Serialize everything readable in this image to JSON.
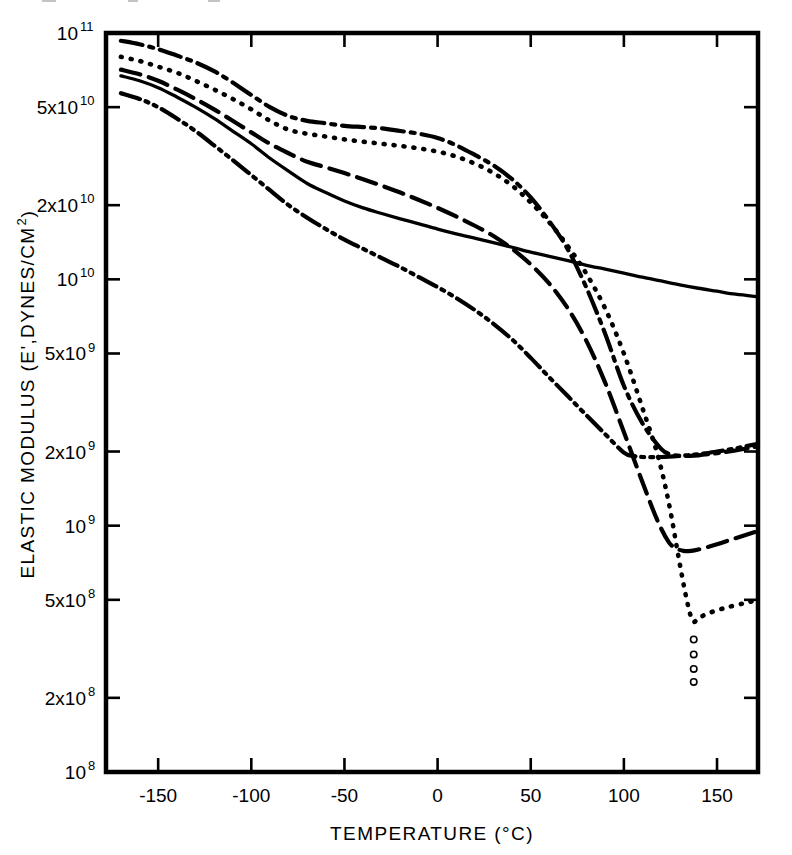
{
  "figure": {
    "background_color": "#ffffff",
    "ink_color": "#000000"
  },
  "chart_data": {
    "type": "line",
    "title": "",
    "subtitle": "",
    "xlabel": "TEMPERATURE (°C)",
    "ylabel": "ELASTIC MODULUS (E', DYNES/CM²)",
    "ylabel_parts": {
      "main": "ELASTIC MODULUS (E',DYNES/CM",
      "superscript": "2",
      "tail": ")"
    },
    "xscale": "linear",
    "yscale": "log",
    "xlim": [
      -178,
      172
    ],
    "ylim": [
      100000000,
      100000000000
    ],
    "grid": false,
    "legend": "none",
    "legend_position": "none",
    "xticks": [
      -150,
      -100,
      -50,
      0,
      50,
      100,
      150
    ],
    "xtick_labels": [
      "-150",
      "-100",
      "-50",
      "0",
      "50",
      "100",
      "150"
    ],
    "yticks": [
      100000000000,
      50000000000,
      20000000000,
      10000000000,
      5000000000,
      2000000000,
      1000000000,
      500000000,
      200000000,
      100000000
    ],
    "ytick_labels": [
      {
        "mantissa": "10",
        "exponent": "11"
      },
      {
        "mantissa": "5x10",
        "exponent": "10"
      },
      {
        "mantissa": "2x10",
        "exponent": "10"
      },
      {
        "mantissa": "10",
        "exponent": "10"
      },
      {
        "mantissa": "5x10",
        "exponent": "9"
      },
      {
        "mantissa": "2x10",
        "exponent": "9"
      },
      {
        "mantissa": "10",
        "exponent": "9"
      },
      {
        "mantissa": "5x10",
        "exponent": "8"
      },
      {
        "mantissa": "2x10",
        "exponent": "8"
      },
      {
        "mantissa": "10",
        "exponent": "8"
      }
    ],
    "series": [
      {
        "name": "curve-dash-dot",
        "style": "dash-dot",
        "dasharray": "22,7,4,7",
        "linewidth": 4.2,
        "x": [
          -170,
          -160,
          -150,
          -140,
          -130,
          -120,
          -110,
          -100,
          -90,
          -80,
          -70,
          -60,
          -50,
          -40,
          -30,
          -20,
          -10,
          0,
          10,
          20,
          30,
          40,
          50,
          60,
          70,
          80,
          90,
          100,
          110,
          120,
          125,
          130,
          135,
          140,
          150,
          160,
          172
        ],
        "y": [
          93000000000.0,
          90000000000.0,
          86000000000.0,
          81000000000.0,
          76000000000.0,
          70000000000.0,
          63000000000.0,
          56000000000.0,
          50000000000.0,
          46000000000.0,
          44000000000.0,
          43000000000.0,
          42000000000.0,
          41500000000.0,
          41000000000.0,
          40000000000.0,
          39000000000.0,
          37500000000.0,
          35000000000.0,
          32000000000.0,
          29000000000.0,
          25500000000.0,
          21500000000.0,
          17200000000.0,
          13200000000.0,
          9200000000.0,
          6000000000.0,
          3700000000.0,
          2600000000.0,
          2050000000.0,
          1950000000.0,
          1920000000.0,
          1920000000.0,
          1930000000.0,
          1970000000.0,
          2020000000.0,
          2100000000.0
        ]
      },
      {
        "name": "curve-dotted",
        "style": "dotted",
        "dasharray": "1,9",
        "linewidth": 4.6,
        "x": [
          -170,
          -160,
          -150,
          -140,
          -130,
          -120,
          -110,
          -100,
          -90,
          -80,
          -70,
          -60,
          -50,
          -40,
          -30,
          -20,
          -10,
          0,
          10,
          20,
          30,
          40,
          50,
          60,
          70,
          80,
          90,
          100,
          110,
          118,
          124,
          130,
          134,
          137,
          140,
          145,
          155,
          165,
          172
        ],
        "y": [
          80000000000.0,
          77000000000.0,
          73000000000.0,
          69000000000.0,
          64000000000.0,
          59000000000.0,
          54000000000.0,
          49000000000.0,
          44000000000.0,
          40500000000.0,
          39000000000.0,
          38000000000.0,
          37000000000.0,
          36200000000.0,
          35500000000.0,
          34800000000.0,
          34000000000.0,
          33000000000.0,
          31500000000.0,
          29500000000.0,
          27000000000.0,
          24000000000.0,
          20500000000.0,
          17000000000.0,
          13600000000.0,
          10500000000.0,
          7600000000.0,
          5000000000.0,
          3000000000.0,
          1950000000.0,
          1250000000.0,
          700000000.0,
          490000000.0,
          410000000.0,
          420000000.0,
          440000000.0,
          465000000.0,
          485000000.0,
          500000000.0
        ]
      },
      {
        "name": "curve-dashed",
        "style": "dashed",
        "dasharray": "20,9",
        "linewidth": 4.2,
        "x": [
          -170,
          -160,
          -150,
          -140,
          -130,
          -120,
          -110,
          -100,
          -90,
          -80,
          -70,
          -60,
          -50,
          -40,
          -30,
          -20,
          -10,
          0,
          10,
          20,
          30,
          40,
          50,
          60,
          70,
          80,
          90,
          100,
          110,
          118,
          124,
          128,
          132,
          136,
          140,
          150,
          160,
          172
        ],
        "y": [
          71000000000.0,
          68000000000.0,
          64000000000.0,
          59000000000.0,
          54000000000.0,
          49000000000.0,
          44000000000.0,
          39500000000.0,
          35500000000.0,
          32500000000.0,
          30000000000.0,
          28500000000.0,
          27000000000.0,
          25500000000.0,
          24000000000.0,
          22500000000.0,
          21000000000.0,
          19500000000.0,
          18000000000.0,
          16500000000.0,
          15000000000.0,
          13300000000.0,
          11500000000.0,
          9600000000.0,
          7600000000.0,
          5600000000.0,
          3800000000.0,
          2400000000.0,
          1500000000.0,
          1050000000.0,
          860000000.0,
          810000000.0,
          790000000.0,
          790000000.0,
          800000000.0,
          840000000.0,
          890000000.0,
          950000000.0
        ]
      },
      {
        "name": "curve-solid",
        "style": "solid",
        "dasharray": "none",
        "linewidth": 3.3,
        "x": [
          -170,
          -160,
          -150,
          -140,
          -130,
          -120,
          -110,
          -100,
          -90,
          -80,
          -70,
          -60,
          -50,
          -40,
          -30,
          -20,
          -10,
          0,
          10,
          20,
          30,
          40,
          50,
          60,
          70,
          80,
          90,
          100,
          110,
          120,
          130,
          140,
          150,
          160,
          172
        ],
        "y": [
          67000000000.0,
          64000000000.0,
          60000000000.0,
          55000000000.0,
          50000000000.0,
          45000000000.0,
          40000000000.0,
          35500000000.0,
          31000000000.0,
          27500000000.0,
          24500000000.0,
          22500000000.0,
          20800000000.0,
          19500000000.0,
          18500000000.0,
          17600000000.0,
          16800000000.0,
          16000000000.0,
          15300000000.0,
          14700000000.0,
          14100000000.0,
          13500000000.0,
          12900000000.0,
          12400000000.0,
          11900000000.0,
          11400000000.0,
          11000000000.0,
          10600000000.0,
          10200000000.0,
          9850000000.0,
          9500000000.0,
          9200000000.0,
          8950000000.0,
          8700000000.0,
          8500000000.0
        ]
      },
      {
        "name": "curve-dash-dot-dot",
        "style": "dash-dot-dot",
        "dasharray": "20,6,3,6,3,6",
        "linewidth": 4.2,
        "x": [
          -170,
          -160,
          -150,
          -140,
          -130,
          -120,
          -110,
          -100,
          -90,
          -80,
          -70,
          -60,
          -50,
          -40,
          -30,
          -20,
          -10,
          0,
          10,
          20,
          30,
          40,
          50,
          60,
          70,
          80,
          90,
          100,
          105,
          110,
          120,
          130,
          140,
          150,
          160,
          172
        ],
        "y": [
          57000000000.0,
          54000000000.0,
          50000000000.0,
          45000000000.0,
          40000000000.0,
          35000000000.0,
          30500000000.0,
          26500000000.0,
          23000000000.0,
          20000000000.0,
          17800000000.0,
          16000000000.0,
          14500000000.0,
          13300000000.0,
          12200000000.0,
          11200000000.0,
          10200000000.0,
          9300000000.0,
          8400000000.0,
          7500000000.0,
          6600000000.0,
          5700000000.0,
          4800000000.0,
          4000000000.0,
          3350000000.0,
          2800000000.0,
          2350000000.0,
          1980000000.0,
          1920000000.0,
          1900000000.0,
          1900000000.0,
          1920000000.0,
          1950000000.0,
          2000000000.0,
          2060000000.0,
          2150000000.0
        ]
      }
    ],
    "markers": [
      {
        "name": "open-circle-points",
        "marker": "open-circle",
        "radius": 3.2,
        "points": [
          {
            "x": 137.5,
            "y": 345000000.0
          },
          {
            "x": 137.5,
            "y": 300000000.0
          },
          {
            "x": 137.5,
            "y": 262000000.0
          },
          {
            "x": 137.5,
            "y": 232000000.0
          }
        ]
      }
    ]
  }
}
